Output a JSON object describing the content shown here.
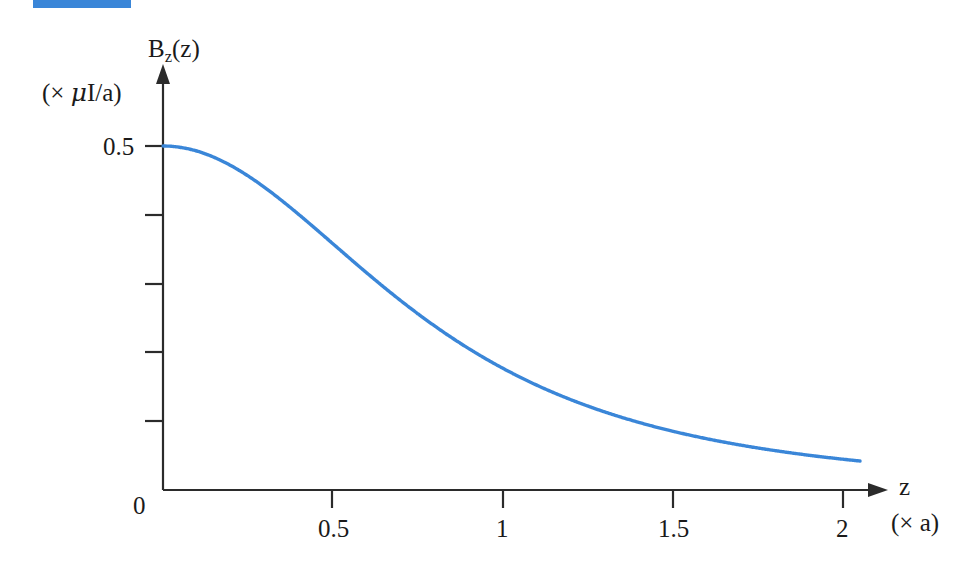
{
  "figure": {
    "accent_color": "#3a86d8",
    "axis_color": "#2b2b2b",
    "top_rule_color": "#3a86d8",
    "y_axis_title": "B",
    "y_axis_title_sub": "z",
    "y_axis_title_arg": "(z)",
    "y_unit_label_open": "(× ",
    "y_unit_label_mu": "μ",
    "y_unit_label_rest": "I/a)",
    "x_axis_title": "z",
    "x_unit_label": "(× a)",
    "origin_label": "0"
  },
  "axes": {
    "y_ticks": [
      "0.5",
      "",
      "",
      "",
      ""
    ],
    "y_tick_values": [
      0.5,
      0.4,
      0.3,
      0.2,
      0.1
    ],
    "y_labeled": [
      "0.5"
    ],
    "x_ticks": [
      "0.5",
      "1",
      "1.5",
      "2"
    ],
    "x_tick_values": [
      0.5,
      1,
      1.5,
      2
    ]
  },
  "chart_data": {
    "type": "line",
    "title": "",
    "subtitle": "",
    "xlabel": "z",
    "ylabel": "B_z(z)",
    "x_unit": "(× a)",
    "y_unit": "(× μI/a)",
    "xlim": [
      0,
      2.1
    ],
    "ylim": [
      0,
      0.55
    ],
    "x_ticks": [
      0,
      0.5,
      1,
      1.5,
      2
    ],
    "x_ticklabels": [
      "0",
      "0.5",
      "1",
      "1.5",
      "2"
    ],
    "y_ticks": [
      0,
      0.1,
      0.2,
      0.3,
      0.4,
      0.5
    ],
    "y_ticklabels": [
      "0",
      "",
      "",
      "",
      "",
      "0.5"
    ],
    "grid": false,
    "legend": "none",
    "series": [
      {
        "name": "B_z(z) = 0.5 / (1 + z^2)^(3/2)",
        "color": "#3a86d8",
        "formula": "0.5*(1+z*z)^(-1.5)",
        "x": [
          0,
          0.1,
          0.2,
          0.3,
          0.4,
          0.5,
          0.6,
          0.7,
          0.8,
          0.9,
          1.0,
          1.1,
          1.2,
          1.3,
          1.4,
          1.5,
          1.6,
          1.7,
          1.8,
          1.9,
          2.0,
          2.05
        ],
        "y": [
          0.5,
          0.4926,
          0.4717,
          0.4398,
          0.4009,
          0.3578,
          0.3149,
          0.2743,
          0.2375,
          0.205,
          0.1768,
          0.1525,
          0.1317,
          0.1141,
          0.0991,
          0.0864,
          0.0757,
          0.0665,
          0.0587,
          0.0519,
          0.046,
          0.0434
        ]
      }
    ],
    "annotations": []
  }
}
